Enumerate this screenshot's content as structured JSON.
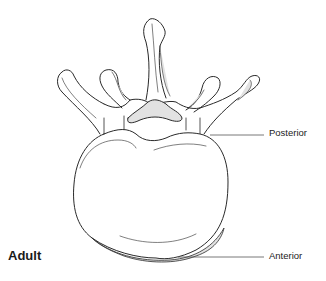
{
  "figure": {
    "labels": {
      "posterior": "Posterior",
      "anterior": "Anterior",
      "age_group": "Adult"
    },
    "colors": {
      "outline": "#2a2a2a",
      "shading": "#e2e2e2",
      "background": "#ffffff",
      "leader_line": "#555555"
    }
  }
}
